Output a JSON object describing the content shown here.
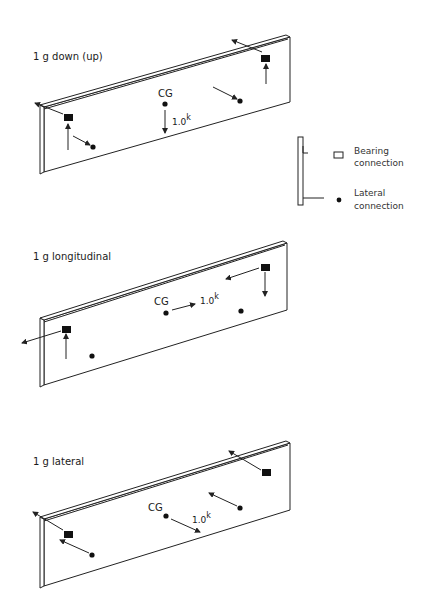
{
  "legend": {
    "bearing_label_1": "Bearing",
    "bearing_label_2": "connection",
    "lateral_label_1": "Lateral",
    "lateral_label_2": "connection"
  },
  "panels": [
    {
      "title": "1 g down (up)",
      "cg_label": "CG",
      "force_value": "1.0",
      "force_unit": "k",
      "load_direction": "down"
    },
    {
      "title": "1 g longitudinal",
      "cg_label": "CG",
      "force_value": "1.0",
      "force_unit": "k",
      "load_direction": "longitudinal"
    },
    {
      "title": "1 g lateral",
      "cg_label": "CG",
      "force_value": "1.0",
      "force_unit": "k",
      "load_direction": "lateral"
    }
  ],
  "colors": {
    "ink": "#222222",
    "background": "#ffffff"
  }
}
